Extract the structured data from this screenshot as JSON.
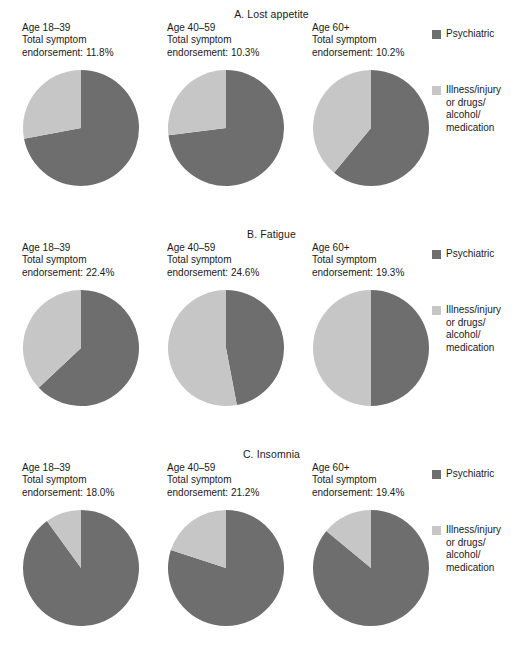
{
  "figure": {
    "title_a": "A. Lost appetite",
    "title_b": "B. Fatigue",
    "title_c": "C. Insomnia"
  },
  "legend": {
    "psychiatric_label": "Psychiatric",
    "illness_label": "Illness/injury or drugs/ alcohol/ medication",
    "illness_line1": "Illness/injury",
    "illness_line2": "or drugs/",
    "illness_line3": "alcohol/",
    "illness_line4": "medication",
    "psychiatric_color": "#6e6e6e",
    "illness_color": "#c6c6c6"
  },
  "captions": {
    "a1_l1": "Age 18–39",
    "a1_l2": "Total symptom",
    "a1_l3": "endorsement: 11.8%",
    "a2_l1": "Age 40–59",
    "a2_l2": "Total symptom",
    "a2_l3": "endorsement: 10.3%",
    "a3_l1": "Age 60+",
    "a3_l2": "Total symptom",
    "a3_l3": "endorsement: 10.2%",
    "b1_l1": "Age 18–39",
    "b1_l2": "Total symptom",
    "b1_l3": "endorsement: 22.4%",
    "b2_l1": "Age 40–59",
    "b2_l2": "Total symptom",
    "b2_l3": "endorsement: 24.6%",
    "b3_l1": "Age 60+",
    "b3_l2": "Total symptom",
    "b3_l3": "endorsement: 19.3%",
    "c1_l1": "Age 18–39",
    "c1_l2": "Total symptom",
    "c1_l3": "endorsement: 18.0%",
    "c2_l1": "Age 40–59",
    "c2_l2": "Total symptom",
    "c2_l3": "endorsement: 21.2%",
    "c3_l1": "Age 60+",
    "c3_l2": "Total symptom",
    "c3_l3": "endorsement: 19.4%"
  },
  "chart_data": [
    {
      "type": "pie",
      "title": "A. Lost appetite",
      "subtitle": "Age 18–39 / Total symptom endorsement: 11.8%",
      "panel": "A",
      "group": "Age 18–39",
      "total_symptom_endorsement_pct": 11.8,
      "labels": [
        "Psychiatric",
        "Illness/injury or drugs/alcohol/medication"
      ],
      "values": [
        72,
        28
      ],
      "colors": [
        "#6e6e6e",
        "#c6c6c6"
      ],
      "start_angle_deg": 0,
      "direction": "clockwise",
      "legend_position": "right"
    },
    {
      "type": "pie",
      "title": "A. Lost appetite",
      "subtitle": "Age 40–59 / Total symptom endorsement: 10.3%",
      "panel": "A",
      "group": "Age 40–59",
      "total_symptom_endorsement_pct": 10.3,
      "labels": [
        "Psychiatric",
        "Illness/injury or drugs/alcohol/medication"
      ],
      "values": [
        73,
        27
      ],
      "colors": [
        "#6e6e6e",
        "#c6c6c6"
      ],
      "start_angle_deg": 0,
      "direction": "clockwise",
      "legend_position": "right"
    },
    {
      "type": "pie",
      "title": "A. Lost appetite",
      "subtitle": "Age 60+ / Total symptom endorsement: 10.2%",
      "panel": "A",
      "group": "Age 60+",
      "total_symptom_endorsement_pct": 10.2,
      "labels": [
        "Psychiatric",
        "Illness/injury or drugs/alcohol/medication"
      ],
      "values": [
        61,
        39
      ],
      "colors": [
        "#6e6e6e",
        "#c6c6c6"
      ],
      "start_angle_deg": 0,
      "direction": "clockwise",
      "legend_position": "right"
    },
    {
      "type": "pie",
      "title": "B. Fatigue",
      "subtitle": "Age 18–39 / Total symptom endorsement: 22.4%",
      "panel": "B",
      "group": "Age 18–39",
      "total_symptom_endorsement_pct": 22.4,
      "labels": [
        "Psychiatric",
        "Illness/injury or drugs/alcohol/medication"
      ],
      "values": [
        63,
        37
      ],
      "colors": [
        "#6e6e6e",
        "#c6c6c6"
      ],
      "start_angle_deg": 0,
      "direction": "clockwise",
      "legend_position": "right"
    },
    {
      "type": "pie",
      "title": "B. Fatigue",
      "subtitle": "Age 40–59 / Total symptom endorsement: 24.6%",
      "panel": "B",
      "group": "Age 40–59",
      "total_symptom_endorsement_pct": 24.6,
      "labels": [
        "Psychiatric",
        "Illness/injury or drugs/alcohol/medication"
      ],
      "values": [
        47,
        53
      ],
      "colors": [
        "#6e6e6e",
        "#c6c6c6"
      ],
      "start_angle_deg": 0,
      "direction": "clockwise",
      "legend_position": "right"
    },
    {
      "type": "pie",
      "title": "B. Fatigue",
      "subtitle": "Age 60+ / Total symptom endorsement: 19.3%",
      "panel": "B",
      "group": "Age 60+",
      "total_symptom_endorsement_pct": 19.3,
      "labels": [
        "Psychiatric",
        "Illness/injury or drugs/alcohol/medication"
      ],
      "values": [
        50,
        50
      ],
      "colors": [
        "#6e6e6e",
        "#c6c6c6"
      ],
      "start_angle_deg": 0,
      "direction": "clockwise",
      "legend_position": "right"
    },
    {
      "type": "pie",
      "title": "C. Insomnia",
      "subtitle": "Age 18–39 / Total symptom endorsement: 18.0%",
      "panel": "C",
      "group": "Age 18–39",
      "total_symptom_endorsement_pct": 18.0,
      "labels": [
        "Psychiatric",
        "Illness/injury or drugs/alcohol/medication"
      ],
      "values": [
        90,
        10
      ],
      "colors": [
        "#6e6e6e",
        "#c6c6c6"
      ],
      "start_angle_deg": 0,
      "direction": "clockwise",
      "legend_position": "right"
    },
    {
      "type": "pie",
      "title": "C. Insomnia",
      "subtitle": "Age 40–59 / Total symptom endorsement: 21.2%",
      "panel": "C",
      "group": "Age 40–59",
      "total_symptom_endorsement_pct": 21.2,
      "labels": [
        "Psychiatric",
        "Illness/injury or drugs/alcohol/medication"
      ],
      "values": [
        80,
        20
      ],
      "colors": [
        "#6e6e6e",
        "#c6c6c6"
      ],
      "start_angle_deg": 0,
      "direction": "clockwise",
      "legend_position": "right"
    },
    {
      "type": "pie",
      "title": "C. Insomnia",
      "subtitle": "Age 60+ / Total symptom endorsement: 19.4%",
      "panel": "C",
      "group": "Age 60+",
      "total_symptom_endorsement_pct": 19.4,
      "labels": [
        "Psychiatric",
        "Illness/injury or drugs/alcohol/medication"
      ],
      "values": [
        86,
        14
      ],
      "colors": [
        "#6e6e6e",
        "#c6c6c6"
      ],
      "start_angle_deg": 0,
      "direction": "clockwise",
      "legend_position": "right"
    }
  ]
}
